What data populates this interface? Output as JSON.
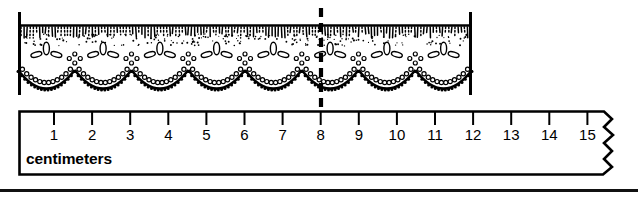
{
  "figure": {
    "kind": "measurement-illustration",
    "ink_color": "#000000",
    "paper_color": "#ffffff"
  },
  "lace": {
    "name": "lace-trim",
    "left_edge_x": 18,
    "right_edge_x": 472,
    "top_y": 17,
    "bottom_y": 95,
    "scallop_count": 8,
    "motif_count": 7,
    "motif_name": "three-petal-flower"
  },
  "marker": {
    "name": "measure-line",
    "style": "dashed",
    "x": 321,
    "top_y": 8,
    "bottom_y": 108,
    "value_cm": "8"
  },
  "ruler": {
    "label": "centimeters",
    "unit": "cm",
    "box": {
      "left": 18,
      "top": 110,
      "right": 612,
      "bottom": 175
    },
    "tick_start_x": 54,
    "tick_spacing": 38.1,
    "torn_edge": "zigzag-right",
    "ticks": [
      {
        "label": "1",
        "value": 1
      },
      {
        "label": "2",
        "value": 2
      },
      {
        "label": "3",
        "value": 3
      },
      {
        "label": "4",
        "value": 4
      },
      {
        "label": "5",
        "value": 5
      },
      {
        "label": "6",
        "value": 6
      },
      {
        "label": "7",
        "value": 7
      },
      {
        "label": "8",
        "value": 8
      },
      {
        "label": "9",
        "value": 9
      },
      {
        "label": "10",
        "value": 10
      },
      {
        "label": "11",
        "value": 11
      },
      {
        "label": "12",
        "value": 12
      },
      {
        "label": "13",
        "value": 13
      },
      {
        "label": "14",
        "value": 14
      },
      {
        "label": "15",
        "value": 15
      }
    ]
  },
  "footer": {
    "divider": true
  }
}
